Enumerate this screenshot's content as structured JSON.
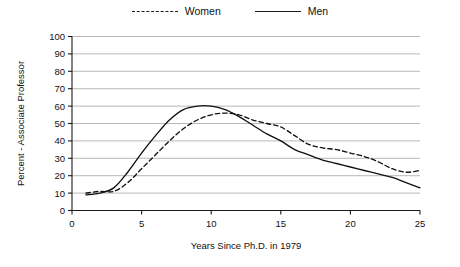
{
  "chart_data": {
    "type": "line",
    "title": "",
    "xlabel": "Years Since Ph.D. in 1979",
    "ylabel": "Percent - Associate Professor",
    "xlim": [
      0,
      25
    ],
    "ylim": [
      0,
      100
    ],
    "grid": true,
    "legend_position": "top-center",
    "xticks": [
      0,
      5,
      10,
      15,
      20,
      25
    ],
    "xtick_labels": [
      "0",
      "5",
      "10",
      "15",
      "20",
      "25"
    ],
    "yticks": [
      0,
      10,
      20,
      30,
      40,
      50,
      60,
      70,
      80,
      90,
      100
    ],
    "ytick_labels": [
      "0",
      "10",
      "20",
      "30",
      "40",
      "50",
      "60",
      "70",
      "80",
      "90",
      "100"
    ],
    "x": [
      1,
      2,
      3,
      4,
      5,
      6,
      7,
      8,
      9,
      10,
      11,
      12,
      13,
      14,
      15,
      16,
      17,
      18,
      19,
      20,
      21,
      22,
      23,
      24,
      25
    ],
    "series": [
      {
        "name": "Women",
        "style": "dashed",
        "color": "#111111",
        "values": [
          10,
          11,
          11,
          16,
          24,
          32,
          40,
          47,
          52,
          55,
          56,
          55,
          52,
          50,
          48,
          43,
          38,
          36,
          35,
          33,
          31,
          28,
          24,
          22,
          23
        ]
      },
      {
        "name": "Men",
        "style": "solid",
        "color": "#111111",
        "values": [
          9,
          10,
          13,
          22,
          33,
          43,
          52,
          58,
          60,
          60,
          58,
          54,
          49,
          44,
          40,
          35,
          32,
          29,
          27,
          25,
          23,
          21,
          19,
          16,
          13
        ]
      }
    ],
    "annotations": []
  },
  "legend": {
    "entries": [
      {
        "label": "Women",
        "style": "dashed"
      },
      {
        "label": "Men",
        "style": "solid"
      }
    ]
  },
  "axes": {
    "y_title": "Percent - Associate Professor",
    "x_title": "Years Since Ph.D. in 1979"
  }
}
